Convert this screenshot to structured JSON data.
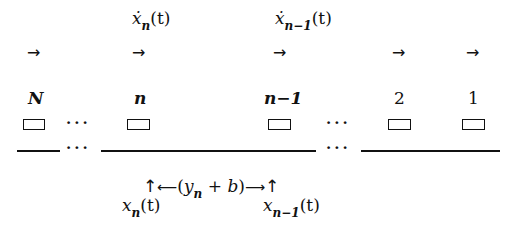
{
  "figure": {
    "type": "car-following platoon diagram",
    "direction": "right"
  },
  "velocity_labels": [
    {
      "id": "n",
      "base": "ẋ",
      "subscript": "n",
      "arg": "(t)"
    },
    {
      "id": "n-1",
      "base": "ẋ",
      "subscript": "n−1",
      "arg": "(t)"
    }
  ],
  "direction_arrows": [
    "→",
    "→",
    "→",
    "→",
    "→"
  ],
  "vehicles": [
    {
      "label": "N",
      "italic": true
    },
    {
      "label": "n",
      "italic": true
    },
    {
      "label": "n−1",
      "italic": true
    },
    {
      "label": "2",
      "italic": false
    },
    {
      "label": "1",
      "italic": false
    }
  ],
  "ellipsis": "···",
  "headway": {
    "left_marker": "↑",
    "left_arrow": "⟵",
    "expression_open": "(",
    "y_base": "y",
    "y_subscript": "n",
    "plus": "+",
    "b": "b",
    "expression_close": ")",
    "right_arrow": "⟶",
    "right_marker": "↑"
  },
  "position_labels": [
    {
      "id": "n",
      "base": "x",
      "subscript": "n",
      "arg": "(t)"
    },
    {
      "id": "n-1",
      "base": "x",
      "subscript": "n−1",
      "arg": "(t)"
    }
  ]
}
